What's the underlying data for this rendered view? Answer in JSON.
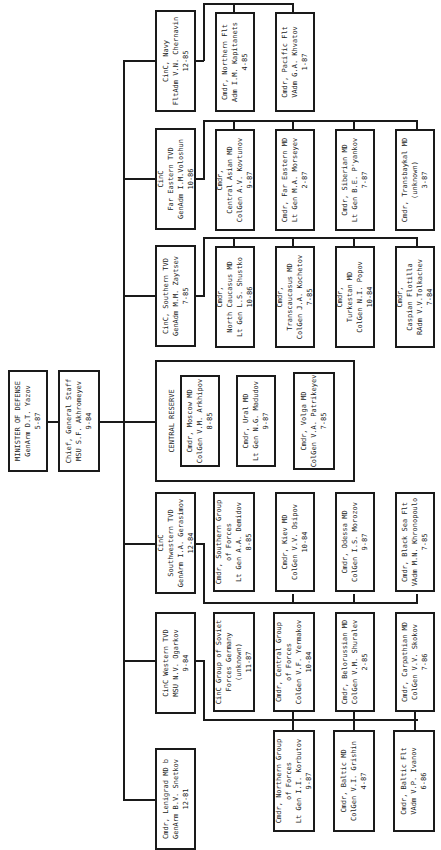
{
  "orientation": "rotated-90-ccw",
  "root": {
    "title": "MINISTER OF DEFENSE",
    "name": "GenArm D.T. Yazov",
    "date": "5-87"
  },
  "chief_staff": {
    "title": "Chief, General Staff",
    "name": "MSU S.F. Akhromeyev",
    "date": "9-84"
  },
  "commands": [
    {
      "id": "navy",
      "text": "CinC, Navy\nFltAdm V.N. Chernavin\n12-85",
      "subs": [
        {
          "text": "Cmdr, Northern Flt\nAdm I.M. Kapitanets\n4-85"
        },
        {
          "text": "Cmdr, Pacific Flt\nVAdm G.A. Khvatov\n1-87"
        }
      ]
    },
    {
      "id": "far-eastern-tvd",
      "text": "CinC\nFar Eastern TVD\nGenAdm I.M.Voloshun\n10-86",
      "subs": [
        {
          "text": "Cmdr,\nCentral Asian MD\nColGen A.V. Kovtunov\n9-87"
        },
        {
          "text": "Cmdr, Far Eastern MD\nLt Gen M.A. Morseyev\n2-87"
        },
        {
          "text": "Cmdr, Siberian MD\nLt Gen B.E. P'yankov\n7-87"
        },
        {
          "text": "Cmdr, Transbaykal MD\n(unknown)\n3-87"
        }
      ]
    },
    {
      "id": "southern-tvd",
      "text": "CinC, Southern TVD\nGenAdm M.M. Zaytsev\n7-85",
      "subs": [
        {
          "text": "Cmdr,\nNorth Caucasus MD\nLt Gen L.S. Shustko\n10-86"
        },
        {
          "text": "Cmdr,\nTranscaucasus MD\nColGen J.A. Kochetov\n7-85"
        },
        {
          "text": "Cmdr,\nTurkestan MD\nColGen N.I. Popov\n10-84"
        },
        {
          "text": "Cmdr,\nCaspian Flotilla\nRAdm V.V.Tolkachev\n7-84"
        }
      ]
    },
    {
      "id": "central-reserve",
      "label": "CENTRAL RESERVE",
      "subs": [
        {
          "text": "Cmdr, Moscow MD\nColGen V.M. Arkhipov\n8-85"
        },
        {
          "text": "Cmdr, Ural MD\nLt Gen N.G. Madudov\n9-87"
        },
        {
          "text": "Cmdr, Volga MD\nColGen V.A. Patrikeyev\n7-85"
        }
      ]
    },
    {
      "id": "southwestern-tvd",
      "text": "CinC\nSouthwestern TVD\nGenArm I.A. Gerasimov\n12-84",
      "subs": [
        {
          "text": "Cmdr, Southern Group\nof Forces\nLt Gen A.A. Demidov\n8-85"
        },
        {
          "text": "Cmdr, Kiev MD\nColGen V.V. Osipov\n10-84"
        },
        {
          "text": "Cmdr, Odessa MD\nColGen I.S. Morozov\n9-87"
        },
        {
          "text": "Cmdr, Black Sea Flt\nVAdm M.N. Khronopoulo\n7-85"
        }
      ]
    },
    {
      "id": "western-tvd",
      "text": "CinC Western TVD\nMSU N.V. Ogarkov\n9-84",
      "subs": [
        {
          "text": "CinC Group of Soviet\nForces Germany\n(unknown)\n11-87"
        },
        {
          "text": "Cmdr, Central Group\nof Forces\nColGen V.F. Yermakov\n10-84"
        },
        {
          "text": "Cmdr, Belorussian MD\nColGen V.M. Shuralev\n2-85"
        },
        {
          "text": "Cmdr, Carpathian MD\nColGen V.V. Skokov\n7-86"
        },
        {
          "text": "Cmdr, Northern Group\nof Forces\nLt Gen I.I. Korbutov\n9-87"
        },
        {
          "text": "Cmdr, Baltic MD\nColGen V.I. Grishin\n4-87"
        },
        {
          "text": "Cmdr, Baltic Flt\nVAdm V.P. Ivanov\n6-86"
        }
      ]
    },
    {
      "id": "leningrad-md",
      "text": "Cmdr, Lenigrad MD b\nGenArm B.V. Snetkov\n12-81"
    }
  ]
}
